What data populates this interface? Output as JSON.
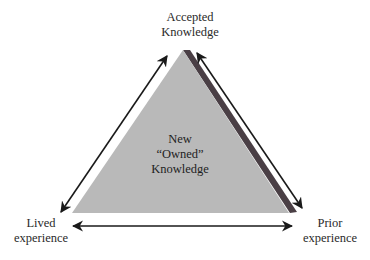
{
  "diagram": {
    "nodes": {
      "top": {
        "line1": "Accepted",
        "line2": "Knowledge"
      },
      "left": {
        "line1": "Lived",
        "line2": "experience"
      },
      "right": {
        "line1": "Prior",
        "line2": "experience"
      },
      "center": {
        "line1": "New",
        "line2": "“Owned”",
        "line3": "Knowledge"
      }
    },
    "edges": [
      {
        "from": "top",
        "to": "left",
        "type": "bidirectional-arrow"
      },
      {
        "from": "top",
        "to": "right",
        "type": "bidirectional-arrow"
      },
      {
        "from": "left",
        "to": "right",
        "type": "bidirectional-arrow"
      }
    ],
    "colors": {
      "triangle_fill": "#b9b9b9",
      "triangle_shadow": "#4a3f45",
      "arrow": "#1a1a1a",
      "text": "#2a2a2a"
    }
  }
}
